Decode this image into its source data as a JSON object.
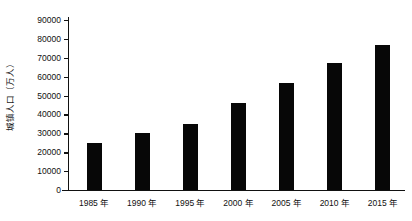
{
  "chart_data": {
    "type": "bar",
    "title": "",
    "xlabel": "",
    "ylabel": "城镇人口（万人）",
    "categories": [
      "1985 年",
      "1990 年",
      "1995 年",
      "2000 年",
      "2005 年",
      "2010 年",
      "2015 年"
    ],
    "values": [
      25000,
      30000,
      35000,
      46000,
      56500,
      67000,
      77000
    ],
    "ylim": [
      0,
      90000
    ],
    "ytick_step": 10000,
    "yticks": [
      0,
      10000,
      20000,
      30000,
      40000,
      50000,
      60000,
      70000,
      80000,
      90000
    ],
    "ytick_labels": [
      "0",
      "10000",
      "20000",
      "30000",
      "40000",
      "50000",
      "60000",
      "70000",
      "80000",
      "90000"
    ],
    "grid": false,
    "legend": null,
    "bar_color": "#070707",
    "axis_color": "#111111",
    "background": "#ffffff"
  }
}
